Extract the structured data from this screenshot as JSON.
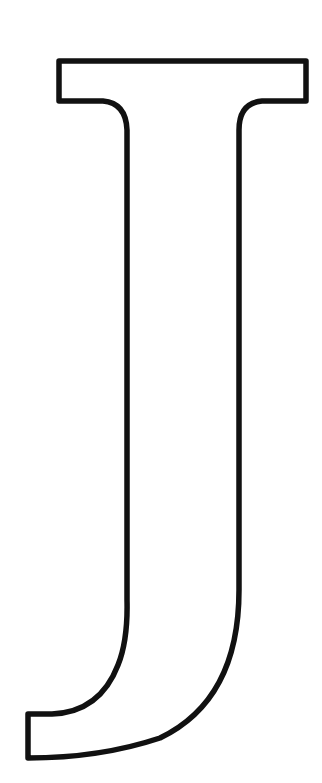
{
  "figure": {
    "letter": "J",
    "style": "outline",
    "background_color": "#ffffff",
    "stroke_color": "#111111",
    "stroke_width": 5
  }
}
